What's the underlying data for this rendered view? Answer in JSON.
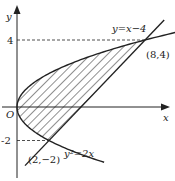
{
  "figure": {
    "type": "region-between-curves",
    "colors": {
      "ink": "#222222",
      "background": "#ffffff"
    },
    "axes": {
      "x_label": "x",
      "y_label": "y",
      "origin_label": "O",
      "y_ticks": [
        {
          "value": 4,
          "label": "4"
        },
        {
          "value": -2,
          "label": "-2"
        }
      ]
    },
    "curves": [
      {
        "name": "parabola",
        "equation_label": "y²=2x"
      },
      {
        "name": "line",
        "equation_label": "y=x−4"
      }
    ],
    "points": [
      {
        "label": "(8,4)",
        "x": 8,
        "y": 4
      },
      {
        "label": "(2,−2)",
        "x": 2,
        "y": -2
      }
    ],
    "shaded_region": "bounded by y²=2x and y=x−4"
  }
}
